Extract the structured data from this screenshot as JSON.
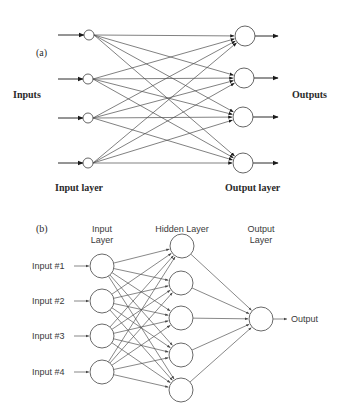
{
  "figure_a": {
    "panel_label": "(a)",
    "inputs_label": "Inputs",
    "outputs_label": "Outputs",
    "input_layer_label": "Input layer",
    "output_layer_label": "Output layer",
    "input_nodes": [
      {
        "x": 89,
        "y": 35
      },
      {
        "x": 88,
        "y": 79
      },
      {
        "x": 88,
        "y": 118
      },
      {
        "x": 88,
        "y": 163
      }
    ],
    "output_nodes": [
      {
        "x": 245,
        "y": 36
      },
      {
        "x": 244,
        "y": 78
      },
      {
        "x": 243,
        "y": 117
      },
      {
        "x": 243,
        "y": 163
      }
    ],
    "input_node_radius": 5,
    "output_node_radius": 10,
    "input_arrow_start_x": 58,
    "output_arrow_end_x": 278
  },
  "figure_b": {
    "panel_label": "(b)",
    "input_layer_title": [
      "Input",
      "Layer"
    ],
    "hidden_layer_title": "Hidden Layer",
    "output_layer_title": [
      "Output",
      "Layer"
    ],
    "inputs": [
      "Input #1",
      "Input #2",
      "Input #3",
      "Input #4"
    ],
    "output_label": "Output",
    "input_nodes": [
      {
        "x": 102,
        "y": 266
      },
      {
        "x": 102,
        "y": 301
      },
      {
        "x": 102,
        "y": 336
      },
      {
        "x": 102,
        "y": 372
      }
    ],
    "hidden_nodes": [
      {
        "x": 182,
        "y": 246
      },
      {
        "x": 181,
        "y": 283
      },
      {
        "x": 181,
        "y": 318
      },
      {
        "x": 181,
        "y": 355
      },
      {
        "x": 181,
        "y": 390
      }
    ],
    "output_node": {
      "x": 261,
      "y": 319
    },
    "node_radius": 12
  }
}
